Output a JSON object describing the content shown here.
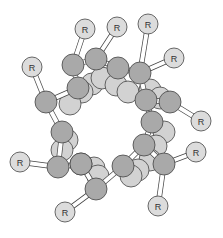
{
  "figure": {
    "title": "",
    "colors": {
      "background": "#ffffff",
      "backbone_atom": "#a9a9a9",
      "back_atom": "#d2d2d2",
      "substituent_atom": "#dcdcdc",
      "outline": "#444444",
      "bond": "#ffffff"
    },
    "substituent_label": "R",
    "back_atoms": [
      {
        "x": 92,
        "y": 84,
        "r": 11
      },
      {
        "x": 102,
        "y": 78,
        "r": 11
      },
      {
        "x": 116,
        "y": 85,
        "r": 11
      },
      {
        "x": 128,
        "y": 92,
        "r": 11
      },
      {
        "x": 82,
        "y": 92,
        "r": 11
      },
      {
        "x": 70,
        "y": 104,
        "r": 11
      },
      {
        "x": 150,
        "y": 90,
        "r": 11
      },
      {
        "x": 160,
        "y": 98,
        "r": 11
      },
      {
        "x": 164,
        "y": 132,
        "r": 11
      },
      {
        "x": 156,
        "y": 146,
        "r": 11
      },
      {
        "x": 150,
        "y": 160,
        "r": 11
      },
      {
        "x": 67,
        "y": 140,
        "r": 11
      },
      {
        "x": 62,
        "y": 150,
        "r": 11
      },
      {
        "x": 94,
        "y": 168,
        "r": 11
      },
      {
        "x": 98,
        "y": 176,
        "r": 11
      },
      {
        "x": 138,
        "y": 170,
        "r": 11
      },
      {
        "x": 131,
        "y": 176,
        "r": 11
      }
    ],
    "backbone_atoms": [
      {
        "x": 73,
        "y": 65,
        "r": 11
      },
      {
        "x": 96,
        "y": 59,
        "r": 11
      },
      {
        "x": 78,
        "y": 88,
        "r": 11
      },
      {
        "x": 46,
        "y": 102,
        "r": 11
      },
      {
        "x": 118,
        "y": 68,
        "r": 11
      },
      {
        "x": 140,
        "y": 73,
        "r": 11
      },
      {
        "x": 146,
        "y": 100,
        "r": 11
      },
      {
        "x": 170,
        "y": 102,
        "r": 11
      },
      {
        "x": 152,
        "y": 122,
        "r": 11
      },
      {
        "x": 164,
        "y": 164,
        "r": 11
      },
      {
        "x": 144,
        "y": 145,
        "r": 11
      },
      {
        "x": 62,
        "y": 132,
        "r": 11
      },
      {
        "x": 58,
        "y": 167,
        "r": 11
      },
      {
        "x": 81,
        "y": 164,
        "r": 11
      },
      {
        "x": 96,
        "y": 189,
        "r": 11
      },
      {
        "x": 123,
        "y": 166,
        "r": 11
      },
      {
        "x": 81,
        "y": 164,
        "r": 11
      }
    ],
    "substituents": [
      {
        "x": 85,
        "y": 29,
        "r": 10,
        "to": 0
      },
      {
        "x": 117,
        "y": 27,
        "r": 10,
        "to": 1
      },
      {
        "x": 148,
        "y": 24,
        "r": 10,
        "to": 5
      },
      {
        "x": 32,
        "y": 67,
        "r": 10,
        "to": 3
      },
      {
        "x": 174,
        "y": 58,
        "r": 10,
        "to": 5
      },
      {
        "x": 201,
        "y": 121,
        "r": 10,
        "to": 7
      },
      {
        "x": 196,
        "y": 152,
        "r": 10,
        "to": 9
      },
      {
        "x": 158,
        "y": 206,
        "r": 10,
        "to": 9
      },
      {
        "x": 20,
        "y": 162,
        "r": 10,
        "to": 12
      },
      {
        "x": 65,
        "y": 212,
        "r": 10,
        "to": 14
      }
    ],
    "backbone_bonds": [
      [
        0,
        1
      ],
      [
        0,
        2
      ],
      [
        2,
        3
      ],
      [
        1,
        4
      ],
      [
        4,
        5
      ],
      [
        5,
        6
      ],
      [
        6,
        7
      ],
      [
        6,
        8
      ],
      [
        8,
        10
      ],
      [
        10,
        9
      ],
      [
        3,
        11
      ],
      [
        11,
        12
      ],
      [
        12,
        13
      ],
      [
        13,
        14
      ],
      [
        14,
        15
      ],
      [
        15,
        10
      ]
    ]
  }
}
